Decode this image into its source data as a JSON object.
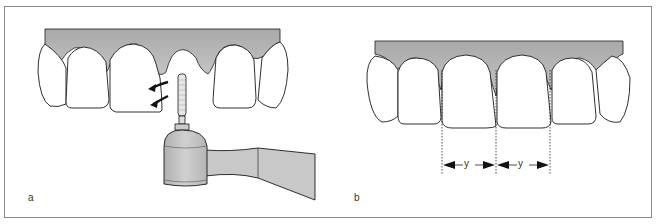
{
  "figure": {
    "panels": [
      {
        "id": "a",
        "label": "a",
        "description": "Upper anterior teeth with rotating bur on handpiece; curved arrows indicate rotation direction at mesial edge of central incisor"
      },
      {
        "id": "b",
        "label": "b",
        "description": "Upper anterior teeth with dotted vertical guide lines at interproximal contacts; two equal widths marked y"
      }
    ],
    "dimension_labels": [
      "y",
      "y"
    ],
    "colors": {
      "gingiva": "#b3b3b3",
      "handpiece": "#bdbdbd",
      "outline": "#1a1a1a",
      "frame": "#8a8a8a"
    }
  }
}
